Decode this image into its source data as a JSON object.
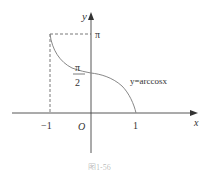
{
  "figure": {
    "function_label": "y=arccosx",
    "axes": {
      "x_label": "x",
      "y_label": "y",
      "origin_label": "O"
    },
    "ticks": {
      "x_neg_one": "−1",
      "x_one": "1",
      "y_pi": "π",
      "y_half_pi_num": "π",
      "y_half_pi_den": "2"
    },
    "caption": "图1-56",
    "colors": {
      "axis": "#444444",
      "curve": "#888888",
      "dashed": "#555555",
      "text": "#333333"
    }
  }
}
